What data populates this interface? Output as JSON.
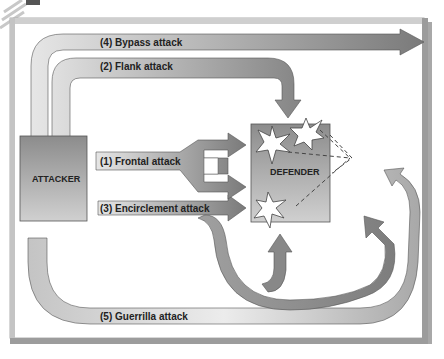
{
  "diagram": {
    "nodes": {
      "attacker": {
        "label": "ATTACKER"
      },
      "defender": {
        "label": "DEFENDER"
      }
    },
    "arrows": [
      {
        "id": "bypass",
        "label": "(4) Bypass attack"
      },
      {
        "id": "flank",
        "label": "(2) Flank attack"
      },
      {
        "id": "frontal",
        "label": "(1) Frontal attack"
      },
      {
        "id": "encirclement",
        "label": "(3) Encirclement attack"
      },
      {
        "id": "guerrilla",
        "label": "(5) Guerrilla attack"
      }
    ],
    "colors": {
      "arrow_dark": "#7a7a7a",
      "arrow_light": "#d8d8d8",
      "box_dark": "#8a8a8a",
      "box_light": "#c8c8c8",
      "frame_shadow": "#9a9a9a"
    }
  }
}
